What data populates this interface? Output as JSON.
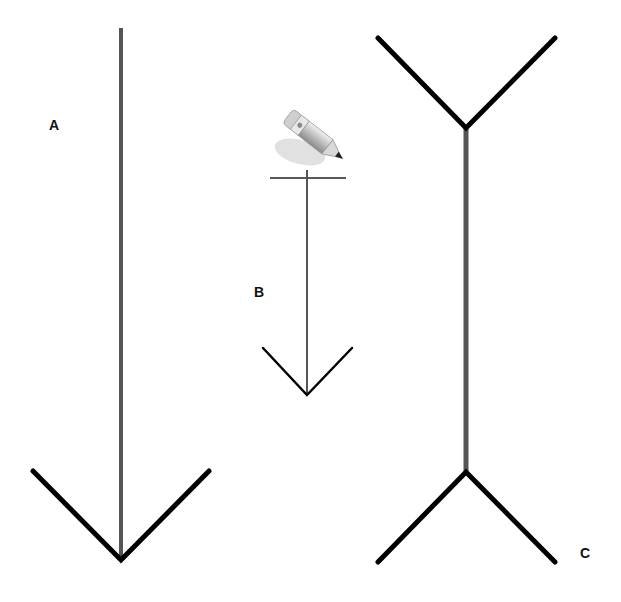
{
  "labels": {
    "a": "A",
    "b": "B",
    "c": "C"
  },
  "colors": {
    "shaft": "#555555",
    "fins": "#000000",
    "background": "#ffffff"
  },
  "figures": [
    {
      "id": "A",
      "shaft": {
        "x": 121,
        "y1": 28,
        "y2": 560
      },
      "fins": "arrowhead-down-bottom"
    },
    {
      "id": "B",
      "shaft": {
        "x": 307,
        "y1": 178,
        "y2": 395
      },
      "fins": "arrowhead-down-bottom",
      "top_bar": {
        "x1": 270,
        "x2": 346,
        "y": 178
      }
    },
    {
      "id": "C",
      "shaft": {
        "x": 466,
        "y1": 128,
        "y2": 472
      },
      "fins": "outward-both-ends"
    }
  ],
  "icon": "pencil-icon"
}
